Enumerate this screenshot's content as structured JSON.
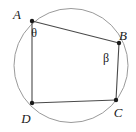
{
  "figure": {
    "type": "cyclic-quadrilateral-in-circle",
    "background_color": "#ffffff",
    "circle": {
      "name": "circumscribed-circle",
      "center_x": 71,
      "center_y": 65.5,
      "radius": 57,
      "stroke_color": "#9a9a9a",
      "stroke_width": 1
    },
    "chords": {
      "stroke_color": "#4a4a4a",
      "stroke_width": 1.1,
      "segments": [
        {
          "name": "chord-AB",
          "from": "A",
          "to": "B"
        },
        {
          "name": "chord-BC",
          "from": "B",
          "to": "C"
        },
        {
          "name": "chord-CD",
          "from": "C",
          "to": "D"
        },
        {
          "name": "chord-DA",
          "from": "D",
          "to": "A"
        }
      ]
    },
    "vertices": [
      {
        "id": "A",
        "label": "A",
        "x": 32,
        "y": 21,
        "label_x": 17,
        "label_y": 19
      },
      {
        "id": "B",
        "label": "B",
        "x": 119,
        "y": 43,
        "label_x": 123,
        "label_y": 40
      },
      {
        "id": "C",
        "label": "C",
        "x": 116,
        "y": 100,
        "label_x": 118,
        "label_y": 117
      },
      {
        "id": "D",
        "label": "D",
        "x": 32,
        "y": 103,
        "label_x": 26,
        "label_y": 123
      }
    ],
    "vertex_dot": {
      "name": "vertex-dot",
      "radius": 2.2,
      "fill_color": "#1a1a1a"
    },
    "angles": [
      {
        "id": "theta",
        "label": "θ",
        "at_vertex": "A",
        "label_x": 34,
        "label_y": 37
      },
      {
        "id": "beta",
        "label": "β",
        "at_vertex": "B",
        "label_x": 106,
        "label_y": 62
      }
    ]
  }
}
